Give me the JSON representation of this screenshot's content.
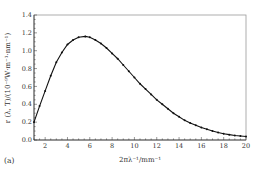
{
  "chart_data": {
    "type": "line",
    "title": "",
    "panel_label": "(a)",
    "xlabel": "2πλ⁻¹/mm⁻¹",
    "ylabel": "r (λ, T)/(10⁻⁹W·m⁻¹·nm⁻¹)",
    "xlim": [
      1,
      20
    ],
    "ylim": [
      0.0,
      1.4
    ],
    "xticks": [
      2,
      4,
      6,
      8,
      10,
      12,
      14,
      16,
      18,
      20
    ],
    "yticks": [
      0.0,
      0.2,
      0.4,
      0.6,
      0.8,
      1.0,
      1.2,
      1.4
    ],
    "ytick_labels": [
      "0.0",
      "0.2",
      "0.4",
      "0.6",
      "0.8",
      "1.0",
      "1.2",
      "1.4"
    ],
    "grid": false,
    "legend": null,
    "series": [
      {
        "name": "r(λ,T)",
        "marker": "dot",
        "color": "#111111",
        "x": [
          1,
          1.5,
          2,
          2.5,
          3,
          3.5,
          4,
          4.5,
          5,
          5.6,
          6,
          6.5,
          7,
          7.5,
          8,
          8.5,
          9,
          9.5,
          10,
          10.5,
          11,
          11.5,
          12,
          12.5,
          13,
          13.5,
          14,
          14.5,
          15,
          15.5,
          16,
          16.5,
          17,
          17.5,
          18,
          18.5,
          19,
          19.5,
          20
        ],
        "values": [
          0.2,
          0.38,
          0.55,
          0.72,
          0.87,
          0.98,
          1.07,
          1.12,
          1.15,
          1.16,
          1.15,
          1.12,
          1.08,
          1.03,
          0.97,
          0.91,
          0.84,
          0.77,
          0.7,
          0.63,
          0.57,
          0.51,
          0.45,
          0.4,
          0.35,
          0.3,
          0.26,
          0.22,
          0.19,
          0.165,
          0.14,
          0.12,
          0.1,
          0.085,
          0.07,
          0.06,
          0.05,
          0.045,
          0.04
        ]
      }
    ]
  }
}
